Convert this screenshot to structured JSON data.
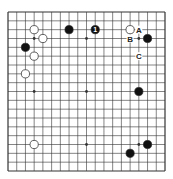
{
  "diagram": {
    "type": "go-board",
    "size": 19,
    "colors": {
      "line": "#333333",
      "black": "#111111",
      "white": "#ffffff",
      "background": "#ffffff"
    },
    "stones": [
      {
        "color": "white",
        "col": 3,
        "row": 2
      },
      {
        "color": "white",
        "col": 4,
        "row": 3
      },
      {
        "color": "black",
        "col": 2,
        "row": 4
      },
      {
        "color": "white",
        "col": 3,
        "row": 5
      },
      {
        "color": "white",
        "col": 2,
        "row": 7
      },
      {
        "color": "black",
        "col": 7,
        "row": 2
      },
      {
        "color": "black",
        "col": 10,
        "row": 2,
        "label": "1"
      },
      {
        "color": "white",
        "col": 14,
        "row": 2
      },
      {
        "color": "black",
        "col": 16,
        "row": 3
      },
      {
        "color": "black",
        "col": 15,
        "row": 9
      },
      {
        "color": "white",
        "col": 3,
        "row": 15
      },
      {
        "color": "black",
        "col": 16,
        "row": 15
      },
      {
        "color": "black",
        "col": 14,
        "row": 16
      }
    ],
    "markers": [
      {
        "label": "A",
        "col": 15,
        "row": 2
      },
      {
        "label": "B",
        "col": 14,
        "row": 3
      },
      {
        "label": "C",
        "col": 15,
        "row": 5
      }
    ]
  }
}
